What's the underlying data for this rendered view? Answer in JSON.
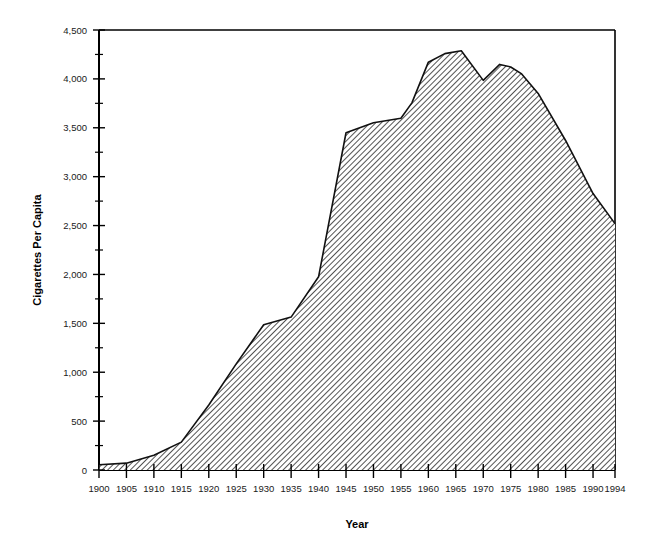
{
  "chart_data": {
    "type": "area",
    "title": "",
    "xlabel": "Year",
    "ylabel": "Cigarettes Per Capita",
    "xlim": [
      1900,
      1994
    ],
    "ylim": [
      0,
      4500
    ],
    "grid": false,
    "legend": "none",
    "fill_style": "diagonal-hatch",
    "x_tick_labels": [
      "1900",
      "1905",
      "1910",
      "1915",
      "1920",
      "1925",
      "1930",
      "1935",
      "1940",
      "1945",
      "1950",
      "1955",
      "1960",
      "1965",
      "1970",
      "1975",
      "1980",
      "1985",
      "1990",
      "1994"
    ],
    "x_ticks": [
      1900,
      1905,
      1910,
      1915,
      1920,
      1925,
      1930,
      1935,
      1940,
      1945,
      1950,
      1955,
      1960,
      1965,
      1970,
      1975,
      1980,
      1985,
      1990,
      1994
    ],
    "y_tick_labels": [
      "0",
      "500",
      "1,000",
      "1,500",
      "2,000",
      "2,500",
      "3,000",
      "3,500",
      "4,000",
      "4,500"
    ],
    "y_ticks": [
      0,
      500,
      1000,
      1500,
      2000,
      2500,
      3000,
      3500,
      4000,
      4500
    ],
    "y_minor_ticks": [
      250,
      750,
      1250,
      1750,
      2250,
      2750,
      3250,
      3750,
      4250
    ],
    "x": [
      1900,
      1905,
      1910,
      1915,
      1920,
      1925,
      1930,
      1935,
      1940,
      1945,
      1950,
      1955,
      1957,
      1960,
      1963,
      1966,
      1970,
      1973,
      1975,
      1977,
      1980,
      1985,
      1990,
      1994
    ],
    "values": [
      54,
      70,
      151,
      285,
      665,
      1085,
      1485,
      1564,
      1976,
      3449,
      3552,
      3597,
      3755,
      4171,
      4258,
      4287,
      3985,
      4148,
      4122,
      4051,
      3851,
      3370,
      2827,
      2520
    ],
    "series": [
      {
        "name": "Cigarettes Per Capita",
        "x": [
          1900,
          1905,
          1910,
          1915,
          1920,
          1925,
          1930,
          1935,
          1940,
          1945,
          1950,
          1955,
          1957,
          1960,
          1963,
          1966,
          1970,
          1973,
          1975,
          1977,
          1980,
          1985,
          1990,
          1994
        ],
        "values": [
          54,
          70,
          151,
          285,
          665,
          1085,
          1485,
          1564,
          1976,
          3449,
          3552,
          3597,
          3755,
          4171,
          4258,
          4287,
          3985,
          4148,
          4122,
          4051,
          3851,
          3370,
          2827,
          2520
        ]
      }
    ],
    "colors": {
      "line": "#111111",
      "fill": "#ffffff",
      "hatch": "#1a1a1a",
      "axis": "#000000"
    }
  }
}
